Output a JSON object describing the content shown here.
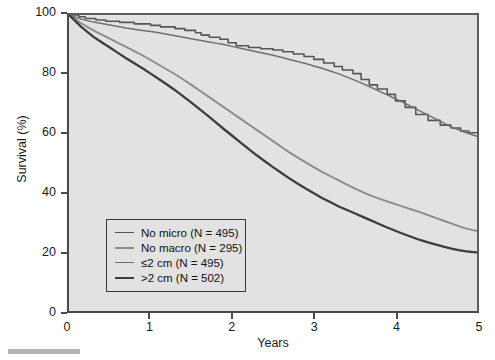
{
  "chart_data": {
    "type": "line",
    "title": "",
    "xlabel": "Years",
    "ylabel": "Survival (%)",
    "xlim": [
      0,
      5
    ],
    "ylim": [
      0,
      100
    ],
    "xticks": [
      0,
      1,
      2,
      3,
      4,
      5
    ],
    "yticks": [
      0,
      20,
      40,
      60,
      80,
      100
    ],
    "grid": false,
    "legend_position": "lower-left-inside",
    "plot_background": "#e2e2e2",
    "series": [
      {
        "name": "No micro (N = 495)",
        "label": "No micro",
        "n": 495,
        "color": "#555555",
        "line_width": 1.6,
        "style": "step",
        "x": [
          0,
          0.12,
          0.2,
          0.33,
          0.45,
          0.62,
          0.8,
          1.0,
          1.12,
          1.3,
          1.42,
          1.55,
          1.62,
          1.72,
          1.85,
          1.95,
          2.05,
          2.2,
          2.35,
          2.5,
          2.62,
          2.75,
          2.88,
          3.0,
          3.12,
          3.25,
          3.35,
          3.48,
          3.58,
          3.68,
          3.78,
          3.9,
          4.0,
          4.12,
          4.25,
          4.4,
          4.55,
          4.68,
          4.8,
          4.9,
          5.0
        ],
        "y": [
          100,
          99.4,
          98.8,
          98.3,
          97.9,
          97.5,
          97.0,
          96.5,
          96.0,
          95.4,
          94.8,
          94.0,
          93.2,
          92.5,
          91.8,
          90.6,
          89.6,
          89.0,
          88.6,
          88.2,
          87.6,
          86.8,
          86.0,
          85.0,
          83.8,
          82.6,
          81.4,
          80.2,
          78.2,
          76.4,
          75.0,
          73.2,
          71.0,
          68.8,
          66.4,
          64.4,
          62.8,
          61.8,
          60.8,
          60.2,
          60.0
        ]
      },
      {
        "name": "No macro (N = 295)",
        "label": "No macro",
        "n": 295,
        "color": "#8c8c8c",
        "line_width": 1.9,
        "style": "smooth",
        "x": [
          0,
          0.15,
          0.3,
          0.5,
          0.7,
          0.9,
          1.1,
          1.3,
          1.5,
          1.7,
          1.9,
          2.1,
          2.3,
          2.5,
          2.7,
          2.9,
          3.1,
          3.3,
          3.5,
          3.7,
          3.9,
          4.1,
          4.3,
          4.5,
          4.7,
          4.85,
          5.0
        ],
        "y": [
          100,
          97.2,
          94.8,
          92.0,
          89.2,
          86.4,
          83.2,
          80.0,
          76.4,
          72.6,
          68.8,
          65.0,
          61.2,
          57.4,
          53.6,
          50.2,
          47.0,
          44.2,
          41.4,
          39.0,
          37.0,
          35.2,
          33.4,
          31.4,
          29.4,
          28.0,
          27.0
        ]
      },
      {
        "name": "≤2 cm (N = 495)",
        "label": "≤2 cm",
        "n": 495,
        "color": "#6f6f6f",
        "line_width": 1.5,
        "style": "smooth",
        "x": [
          0,
          0.15,
          0.3,
          0.5,
          0.7,
          0.9,
          1.1,
          1.3,
          1.5,
          1.7,
          1.9,
          2.1,
          2.3,
          2.5,
          2.7,
          2.9,
          3.1,
          3.3,
          3.5,
          3.7,
          3.9,
          4.1,
          4.3,
          4.5,
          4.7,
          4.85,
          5.0
        ],
        "y": [
          100,
          98.6,
          97.6,
          96.6,
          95.6,
          94.8,
          94.0,
          93.0,
          92.0,
          91.0,
          90.0,
          88.8,
          87.6,
          86.4,
          85.0,
          83.6,
          82.0,
          80.2,
          78.0,
          75.6,
          73.0,
          70.4,
          67.6,
          64.8,
          62.0,
          60.4,
          59.0
        ]
      },
      {
        "name": ">2 cm (N = 502)",
        "label": ">2 cm",
        "n": 502,
        "color": "#3d3d3d",
        "line_width": 2.3,
        "style": "smooth",
        "x": [
          0,
          0.15,
          0.3,
          0.5,
          0.7,
          0.9,
          1.1,
          1.3,
          1.5,
          1.7,
          1.9,
          2.1,
          2.3,
          2.5,
          2.7,
          2.9,
          3.1,
          3.3,
          3.5,
          3.7,
          3.9,
          4.1,
          4.3,
          4.5,
          4.7,
          4.85,
          5.0
        ],
        "y": [
          100,
          96.0,
          92.6,
          89.0,
          85.4,
          82.0,
          78.4,
          74.6,
          70.4,
          66.0,
          61.4,
          57.0,
          52.6,
          48.6,
          44.8,
          41.4,
          38.2,
          35.4,
          33.0,
          30.6,
          28.2,
          26.0,
          24.0,
          22.4,
          21.0,
          20.2,
          19.8
        ]
      }
    ]
  },
  "axes": {
    "ylabel": "Survival (%)",
    "xlabel": "Years",
    "yticks": [
      "100",
      "80",
      "60",
      "40",
      "20",
      "0"
    ],
    "xticks": [
      "0",
      "1",
      "2",
      "3",
      "4",
      "5"
    ]
  },
  "legend": {
    "items": [
      {
        "label": "No micro (N = 495)",
        "color": "#555555",
        "width": "1.6px"
      },
      {
        "label": "No macro (N = 295)",
        "color": "#8c8c8c",
        "width": "2.2px"
      },
      {
        "label": "≤2 cm (N = 495)",
        "color": "#6f6f6f",
        "width": "1.6px"
      },
      {
        "label": ">2 cm (N = 502)",
        "color": "#3d3d3d",
        "width": "2.6px"
      }
    ]
  }
}
